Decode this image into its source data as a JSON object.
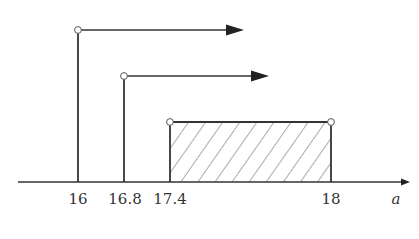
{
  "diagram": {
    "type": "number-line-intervals",
    "axis": {
      "variable": "a",
      "ticks": [
        "16",
        "16.8",
        "17.4",
        "18"
      ]
    },
    "intervals": [
      {
        "name": "ray-from-16",
        "start": "16",
        "start_open": true,
        "direction": "right"
      },
      {
        "name": "ray-from-16.8",
        "start": "16.8",
        "start_open": true,
        "direction": "right"
      },
      {
        "name": "segment-17.4-18",
        "start": "17.4",
        "end": "18",
        "start_open": true,
        "end_open": true,
        "hatched": true
      }
    ]
  },
  "labels": {
    "t1": "16",
    "t2": "16.8",
    "t3": "17.4",
    "t4": "18",
    "var": "a"
  }
}
